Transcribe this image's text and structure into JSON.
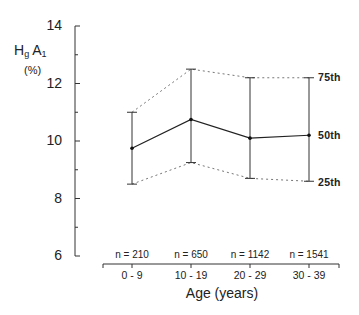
{
  "chart_data": {
    "type": "line",
    "title": "",
    "ylabel": "HgA1 (%)",
    "ylabel_main": "H",
    "ylabel_sub1": "g",
    "ylabel_main2": "A",
    "ylabel_sub2": "1",
    "ylabel_unit": "(%)",
    "xlabel": "Age (years)",
    "ylim": [
      6,
      14
    ],
    "yticks": [
      "6",
      "8",
      "10",
      "12",
      "14"
    ],
    "grid": false,
    "categories": [
      "0 - 9",
      "10 - 19",
      "20 - 29",
      "30 - 39"
    ],
    "sample_sizes": [
      "n = 210",
      "n = 650",
      "n = 1142",
      "n = 1541"
    ],
    "series": [
      {
        "name": "75th",
        "style": "dotted",
        "values": [
          11.0,
          12.5,
          12.2,
          12.2
        ]
      },
      {
        "name": "50th",
        "style": "solid",
        "values": [
          9.75,
          10.75,
          10.1,
          10.2
        ]
      },
      {
        "name": "25th",
        "style": "dotted",
        "values": [
          8.5,
          9.25,
          8.7,
          8.6
        ]
      }
    ],
    "series_labels": {
      "p75": "75th",
      "p50": "50th",
      "p25": "25th"
    }
  }
}
